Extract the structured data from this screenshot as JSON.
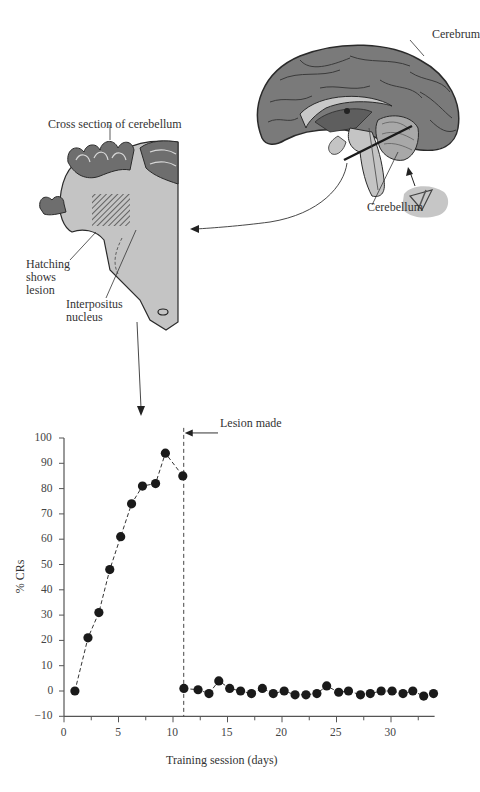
{
  "figure": {
    "labels": {
      "cerebrum": "Cerebrum",
      "cerebellum": "Cerebellum",
      "cross_section": "Cross section of cerebellum",
      "hatching_line1": "Hatching",
      "hatching_line2": "shows",
      "hatching_line3": "lesion",
      "interpositus_line1": "Interpositus",
      "interpositus_line2": "nucleus",
      "lesion_made": "Lesion made"
    },
    "colors": {
      "brain_dark": "#7a7a7a",
      "brain_light": "#c4c4c4",
      "outline": "#2a2a2a",
      "point": "#1a1a1a"
    }
  },
  "chart_data": {
    "type": "line",
    "title": "",
    "xlabel": "Training session (days)",
    "ylabel": "% CRs",
    "xlim": [
      0,
      34
    ],
    "ylim": [
      -10,
      100
    ],
    "x_ticks": [
      0,
      5,
      10,
      15,
      20,
      25,
      30
    ],
    "y_ticks": [
      -10,
      0,
      10,
      20,
      30,
      40,
      50,
      60,
      70,
      80,
      90,
      100
    ],
    "grid": false,
    "annotations": [
      {
        "text": "Lesion made",
        "x": 10.8
      }
    ],
    "series": [
      {
        "name": "Pre-lesion",
        "x": [
          1,
          2.2,
          3.2,
          4.2,
          5.2,
          6.2,
          7.2,
          8.4,
          9.3,
          10.9
        ],
        "y": [
          0,
          21,
          31,
          48,
          61,
          74,
          81,
          82,
          94,
          85
        ]
      },
      {
        "name": "Post-lesion",
        "x": [
          11,
          12.3,
          13.3,
          14.2,
          15.2,
          16.2,
          17.2,
          18.2,
          19.2,
          20.2,
          21.2,
          22.2,
          23.2,
          24.1,
          25.2,
          26.1,
          27.2,
          28.1,
          29.1,
          30.1,
          31.1,
          32,
          33,
          33.9
        ],
        "y": [
          1,
          0.5,
          -1,
          4,
          1,
          0,
          -1,
          1,
          -1,
          0,
          -1.5,
          -1.5,
          -1,
          2,
          -0.5,
          0,
          -1.5,
          -1,
          0,
          0,
          -1,
          0,
          -2,
          -1
        ]
      }
    ]
  }
}
